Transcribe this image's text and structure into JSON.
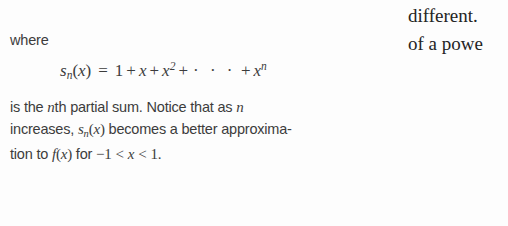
{
  "page": {
    "background_color": "#fdfdfd",
    "text_color": "#3c3c3c",
    "serif_text_color": "#242424"
  },
  "left_column": {
    "where_label": "where",
    "display_equation": {
      "lhs_function": "s",
      "lhs_subscript": "n",
      "lhs_arg_open": "(",
      "lhs_variable": "x",
      "lhs_arg_close": ")",
      "equals": "=",
      "term_one": "1",
      "plus_1": "+",
      "term_x": "x",
      "plus_2": "+",
      "term_x_squared_base": "x",
      "term_x_squared_exponent": "2",
      "plus_3": "+",
      "ellipsis": "· · ·",
      "plus_4": "+",
      "term_x_n_base": "x",
      "term_x_n_exponent": "n",
      "plain_text": "s_n(x) = 1 + x + x^2 + ··· + x^n"
    },
    "paragraph": {
      "line1_a": "is the ",
      "line1_n": "n",
      "line1_b": "th partial sum. Notice that as ",
      "line1_n2": "n",
      "line2_a": "increases, ",
      "line2_s": "s",
      "line2_sub": "n",
      "line2_open": "(",
      "line2_x": "x",
      "line2_close": ")",
      "line2_b": " becomes a better approxima-",
      "line3_a": "tion to ",
      "line3_f": "f",
      "line3_open": "(",
      "line3_x": "x",
      "line3_close": ")",
      "line3_b": " for ",
      "line3_minus_one": "−1",
      "line3_lt1": "<",
      "line3_x2": "x",
      "line3_lt2": "<",
      "line3_one": "1",
      "line3_period": ".",
      "plain_text": "is the nth partial sum. Notice that as n increases, s_n(x) becomes a better approximation to f(x) for −1 < x < 1."
    }
  },
  "right_column": {
    "line1": "different.",
    "line2": "of a powe"
  }
}
